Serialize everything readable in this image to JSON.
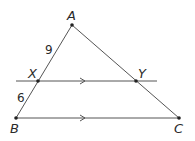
{
  "diagram": {
    "type": "geometry-triangle-parallel-line",
    "colors": {
      "line": "#555555",
      "point": "#222222",
      "text": "#2a2a2a",
      "background": "#ffffff"
    },
    "points": {
      "A": {
        "label": "A",
        "x": 72,
        "y": 25
      },
      "B": {
        "label": "B",
        "x": 16,
        "y": 118
      },
      "C": {
        "label": "C",
        "x": 179,
        "y": 118
      },
      "X": {
        "label": "X",
        "x": 38,
        "y": 81
      },
      "Y": {
        "label": "Y",
        "x": 136,
        "y": 81
      }
    },
    "segments": [
      {
        "from": "A",
        "to": "B"
      },
      {
        "from": "A",
        "to": "C"
      },
      {
        "from": "B",
        "to": "C",
        "parallel_mark": true
      },
      {
        "from": "X",
        "to": "Y",
        "extended": true,
        "parallel_mark": true
      }
    ],
    "measurements": {
      "AX": "9",
      "XB": "6"
    }
  }
}
